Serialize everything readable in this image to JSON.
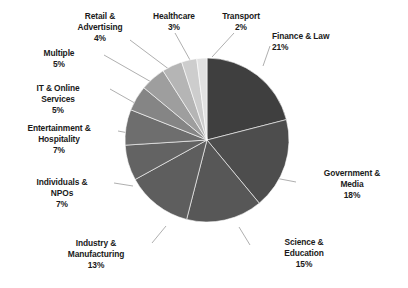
{
  "chart_data": {
    "type": "pie",
    "title": "",
    "subtitle": "",
    "xlabel": "",
    "ylabel": "",
    "legend_position": "none",
    "grid": false,
    "units": "percent",
    "start_angle_deg": 0,
    "direction": "clockwise",
    "categories": [
      "Finance & Law",
      "Government & Media",
      "Science & Education",
      "Industry & Manufacturing",
      "Individuals & NPOs",
      "Entertainment & Hospitality",
      "IT & Online Services",
      "Multiple",
      "Retail & Advertising",
      "Healthcare",
      "Transport"
    ],
    "values": [
      21,
      18,
      15,
      13,
      7,
      7,
      5,
      5,
      4,
      3,
      2
    ],
    "value_labels": [
      "21%",
      "18%",
      "15%",
      "13%",
      "7%",
      "7%",
      "5%",
      "5%",
      "4%",
      "3%",
      "2%"
    ],
    "colors": [
      "#3f3f3f",
      "#4d4d4d",
      "#575757",
      "#5e5e5e",
      "#636363",
      "#6e6e6e",
      "#858585",
      "#9e9e9e",
      "#b5b5b5",
      "#cdcdcd",
      "#e2e2e2"
    ],
    "slices": [
      {
        "name": "Finance & Law",
        "value": 21,
        "value_label": "21%",
        "color": "#3f3f3f",
        "label_line1": "Finance & Law",
        "label_line2": "",
        "label_align": "left"
      },
      {
        "name": "Government & Media",
        "value": 18,
        "value_label": "18%",
        "color": "#4d4d4d",
        "label_line1": "Government &",
        "label_line2": "Media",
        "label_align": "center"
      },
      {
        "name": "Science & Education",
        "value": 15,
        "value_label": "15%",
        "color": "#575757",
        "label_line1": "Science &",
        "label_line2": "Education",
        "label_align": "center"
      },
      {
        "name": "Industry & Manufacturing",
        "value": 13,
        "value_label": "13%",
        "color": "#5e5e5e",
        "label_line1": "Industry &",
        "label_line2": "Manufacturing",
        "label_align": "center"
      },
      {
        "name": "Individuals & NPOs",
        "value": 7,
        "value_label": "7%",
        "color": "#636363",
        "label_line1": "Individuals &",
        "label_line2": "NPOs",
        "label_align": "center"
      },
      {
        "name": "Entertainment & Hospitality",
        "value": 7,
        "value_label": "7%",
        "color": "#6e6e6e",
        "label_line1": "Entertainment &",
        "label_line2": "Hospitality",
        "label_align": "center"
      },
      {
        "name": "IT & Online Services",
        "value": 5,
        "value_label": "5%",
        "color": "#858585",
        "label_line1": "IT & Online",
        "label_line2": "Services",
        "label_align": "center"
      },
      {
        "name": "Multiple",
        "value": 5,
        "value_label": "5%",
        "color": "#9e9e9e",
        "label_line1": "Multiple",
        "label_line2": "",
        "label_align": "center"
      },
      {
        "name": "Retail & Advertising",
        "value": 4,
        "value_label": "4%",
        "color": "#b5b5b5",
        "label_line1": "Retail &",
        "label_line2": "Advertising",
        "label_align": "center"
      },
      {
        "name": "Healthcare",
        "value": 3,
        "value_label": "3%",
        "color": "#cdcdcd",
        "label_line1": "Healthcare",
        "label_line2": "",
        "label_align": "center"
      },
      {
        "name": "Transport",
        "value": 2,
        "value_label": "2%",
        "color": "#e2e2e2",
        "label_line1": "Transport",
        "label_line2": "",
        "label_align": "center"
      }
    ]
  },
  "geometry": {
    "cx": 207,
    "cy": 140,
    "r": 82,
    "leader_color": "#9a9a9a"
  },
  "labels": [
    {
      "id": "finance-law",
      "x": 272,
      "y": 31,
      "w": 120,
      "align": "left"
    },
    {
      "id": "government-media",
      "x": 298,
      "y": 168,
      "w": 108,
      "align": "center"
    },
    {
      "id": "science-education",
      "x": 252,
      "y": 237,
      "w": 104,
      "align": "center"
    },
    {
      "id": "industry-manufacturing",
      "x": 40,
      "y": 238,
      "w": 112,
      "align": "center"
    },
    {
      "id": "individuals-npos",
      "x": 10,
      "y": 177,
      "w": 104,
      "align": "center"
    },
    {
      "id": "entertainment-hospitality",
      "x": 0,
      "y": 123,
      "w": 118,
      "align": "center"
    },
    {
      "id": "it-online-services",
      "x": 6,
      "y": 83,
      "w": 104,
      "align": "center"
    },
    {
      "id": "multiple",
      "x": 14,
      "y": 48,
      "w": 90,
      "align": "center"
    },
    {
      "id": "retail-advertising",
      "x": 58,
      "y": 11,
      "w": 84,
      "align": "center"
    },
    {
      "id": "healthcare",
      "x": 138,
      "y": 11,
      "w": 72,
      "align": "center"
    },
    {
      "id": "transport",
      "x": 205,
      "y": 11,
      "w": 72,
      "align": "center"
    }
  ],
  "leaders": [
    {
      "id": "finance-law",
      "x1": 270,
      "y1": 46,
      "x2": 263,
      "y2": 66
    },
    {
      "id": "government-media",
      "x1": 296,
      "y1": 182,
      "x2": 275,
      "y2": 178
    },
    {
      "id": "science-education",
      "x1": 250,
      "y1": 245,
      "x2": 239,
      "y2": 227
    },
    {
      "id": "industry-manufacturing",
      "x1": 152,
      "y1": 243,
      "x2": 166,
      "y2": 226
    },
    {
      "id": "individuals-npos",
      "x1": 114,
      "y1": 183,
      "x2": 133,
      "y2": 186
    },
    {
      "id": "entertainment-hospitality",
      "x1": 118,
      "y1": 131,
      "x2": 134,
      "y2": 134
    },
    {
      "id": "it-online-services",
      "x1": 110,
      "y1": 89,
      "x2": 140,
      "y2": 106
    },
    {
      "id": "multiple",
      "x1": 104,
      "y1": 55,
      "x2": 153,
      "y2": 83
    },
    {
      "id": "retail-advertising",
      "x1": 130,
      "y1": 40,
      "x2": 170,
      "y2": 70
    },
    {
      "id": "healthcare",
      "x1": 175,
      "y1": 33,
      "x2": 190,
      "y2": 60
    },
    {
      "id": "transport",
      "x1": 234,
      "y1": 33,
      "x2": 212,
      "y2": 57
    }
  ]
}
